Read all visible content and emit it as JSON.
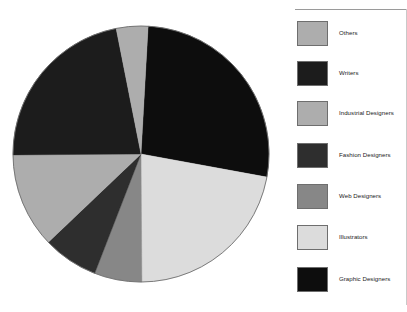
{
  "chart": {
    "type": "pie",
    "title": "",
    "center_x": 141,
    "center_y": 154,
    "radius": 128
  },
  "legend": {
    "name": "legend",
    "position": "right",
    "items": [
      {
        "label": "Others",
        "color": "#adadad",
        "value": 4,
        "start_angle": -11.0,
        "end_angle": 3.4
      },
      {
        "label": "Writers",
        "color": "#1c1c1c",
        "value": 22,
        "start_angle": -90.0,
        "end_angle": -11.0
      },
      {
        "label": "Industrial Designers",
        "color": "#adadad",
        "value": 12,
        "start_angle": -133.0,
        "end_angle": -90.0
      },
      {
        "label": "Fashion Designers",
        "color": "#2e2e2e",
        "value": 7,
        "start_angle": -158.0,
        "end_angle": -133.0
      },
      {
        "label": "Web Designers",
        "color": "#878787",
        "value": 6,
        "start_angle": -180.0,
        "end_angle": -158.0
      },
      {
        "label": "Illustrators",
        "color": "#dcdcdc",
        "value": 22,
        "start_angle": 102.0,
        "end_angle": 180.0
      },
      {
        "label": "Graphic Designers",
        "color": "#0d0d0d",
        "value": 27,
        "start_angle": 3.4,
        "end_angle": 102.0
      }
    ]
  },
  "chart_data": {
    "type": "pie",
    "title": "",
    "subtitle": "",
    "xlabel": "",
    "ylabel": "",
    "legend_position": "right",
    "grid": false,
    "labels": [
      "Graphic Designers",
      "Illustrators",
      "Web Designers",
      "Fashion Designers",
      "Industrial Designers",
      "Writers",
      "Others"
    ],
    "values": [
      27,
      22,
      6,
      7,
      12,
      22,
      4
    ],
    "colors": [
      "#0d0d0d",
      "#dcdcdc",
      "#878787",
      "#2e2e2e",
      "#adadad",
      "#1c1c1c",
      "#adadad"
    ],
    "slices": [
      {
        "label": "Graphic Designers",
        "value": 27,
        "color": "#0d0d0d"
      },
      {
        "label": "Illustrators",
        "value": 22,
        "color": "#dcdcdc"
      },
      {
        "label": "Web Designers",
        "value": 6,
        "color": "#878787"
      },
      {
        "label": "Fashion Designers",
        "value": 7,
        "color": "#2e2e2e"
      },
      {
        "label": "Industrial Designers",
        "value": 12,
        "color": "#adadad"
      },
      {
        "label": "Writers",
        "value": 22,
        "color": "#1c1c1c"
      },
      {
        "label": "Others",
        "value": 4,
        "color": "#adadad"
      }
    ],
    "annotations": []
  }
}
